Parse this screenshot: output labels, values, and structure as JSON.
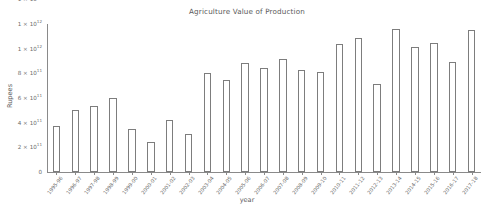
{
  "chart_data": {
    "type": "bar",
    "title": "Agriculture Value of Production",
    "xlabel": "year",
    "ylabel": "Rupees",
    "grid": false,
    "legend": null,
    "ylim": [
      0,
      1200000000000
    ],
    "ytick_labels": [
      "0",
      "2 × 10¹¹",
      "4 × 10¹¹",
      "6 × 10¹¹",
      "8 × 10¹¹",
      "1 × 10¹²",
      "1 × 10¹²",
      "1 × 10¹²",
      "2 × 10¹²"
    ],
    "ytick_values": [
      0,
      200000000000,
      400000000000,
      600000000000,
      800000000000,
      1000000000000,
      1200000000000,
      1400000000000,
      1600000000000
    ],
    "ytick_parts": [
      {
        "mantissa": "0",
        "mul": "",
        "base": "",
        "exp": ""
      },
      {
        "mantissa": "2",
        "mul": "×",
        "base": "10",
        "exp": "11"
      },
      {
        "mantissa": "4",
        "mul": "×",
        "base": "10",
        "exp": "11"
      },
      {
        "mantissa": "6",
        "mul": "×",
        "base": "10",
        "exp": "11"
      },
      {
        "mantissa": "8",
        "mul": "×",
        "base": "10",
        "exp": "11"
      },
      {
        "mantissa": "1",
        "mul": "×",
        "base": "10",
        "exp": "12"
      },
      {
        "mantissa": "1",
        "mul": "×",
        "base": "10",
        "exp": "12"
      },
      {
        "mantissa": "1",
        "mul": "×",
        "base": "10",
        "exp": "12"
      },
      {
        "mantissa": "2",
        "mul": "×",
        "base": "10",
        "exp": "12"
      }
    ],
    "categories": [
      "1995-96",
      "1996-97",
      "1997-98",
      "1998-99",
      "1999-00",
      "2000-01",
      "2001-02",
      "2002-03",
      "2003-04",
      "2004-05",
      "2005-06",
      "2006-07",
      "2007-08",
      "2008-09",
      "2009-10",
      "2010-11",
      "2011-12",
      "2012-13",
      "2013-14",
      "2014-15",
      "2015-16",
      "2016-17",
      "2017-18"
    ],
    "values": [
      370000000000,
      500000000000,
      535000000000,
      600000000000,
      350000000000,
      245000000000,
      420000000000,
      305000000000,
      800000000000,
      745000000000,
      880000000000,
      840000000000,
      920000000000,
      825000000000,
      810000000000,
      1040000000000,
      1090000000000,
      715000000000,
      1160000000000,
      1010000000000,
      1045000000000,
      895000000000,
      1155000000000
    ]
  }
}
